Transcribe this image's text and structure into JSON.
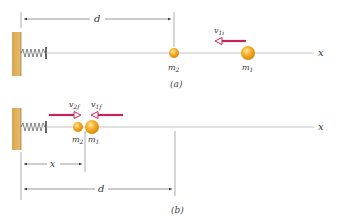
{
  "figure": {
    "panel_a": {
      "caption": "(a)",
      "distance_label": "d",
      "velocity_label": "v",
      "velocity_sub": "1i",
      "mass2_label": "m",
      "mass2_sub": "2",
      "mass1_label": "m",
      "mass1_sub": "1",
      "axis_label": "x"
    },
    "panel_b": {
      "caption": "(b)",
      "distance_label": "d",
      "position_label": "x",
      "velocity2_label": "v",
      "velocity2_sub": "2f",
      "velocity1_label": "v",
      "velocity1_sub": "1f",
      "mass2_label": "m",
      "mass2_sub": "2",
      "mass1_label": "m",
      "mass1_sub": "1",
      "axis_label": "x"
    },
    "colors": {
      "wall": "#E0B060",
      "ball": "#F2A820",
      "arrow": "#C8245A",
      "line": "#9a9a9a"
    }
  }
}
